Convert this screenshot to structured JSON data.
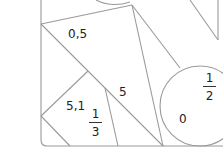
{
  "diagram": {
    "stroke_color": "#9a9a9a",
    "labels": [
      {
        "id": "region-0-5",
        "text": "0,5"
      },
      {
        "id": "region-5",
        "text": "5"
      },
      {
        "id": "region-5-1",
        "text": "5,1"
      },
      {
        "id": "region-0",
        "text": "0"
      }
    ],
    "fractions": [
      {
        "id": "region-one-third",
        "numerator": "1",
        "denominator": "3"
      },
      {
        "id": "region-one-half",
        "numerator": "1",
        "denominator": "2"
      }
    ]
  }
}
